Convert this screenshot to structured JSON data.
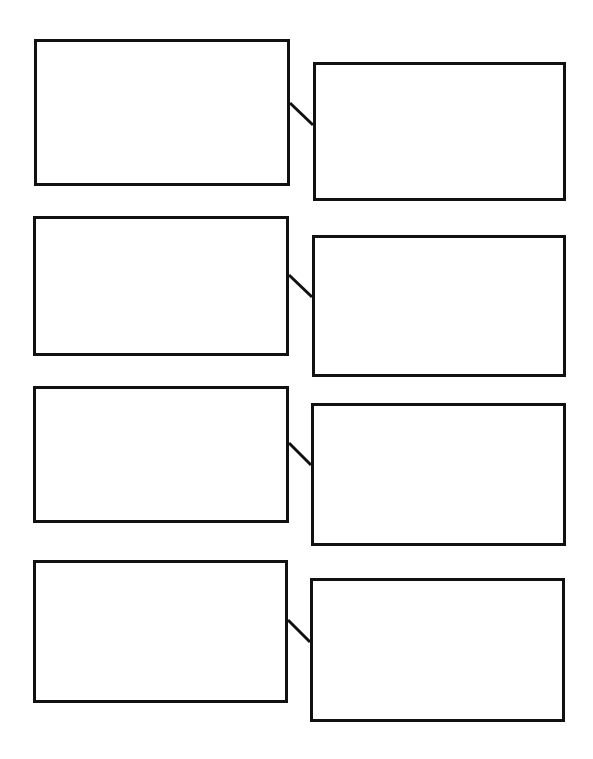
{
  "document": {
    "title": "Blank Paired-Box Graphic Organizer",
    "page_background": "#ffffff",
    "stroke_color": "#111111",
    "stroke_width_px": 3,
    "width_px": 593,
    "height_px": 759
  },
  "rows": [
    {
      "id": "row-1",
      "left_box": {
        "label": "",
        "placeholder": "",
        "x": 34,
        "y": 39,
        "w": 256,
        "h": 147
      },
      "right_box": {
        "label": "",
        "placeholder": "",
        "x": 313,
        "y": 62,
        "w": 253,
        "h": 139
      },
      "connector": {
        "x1": 290,
        "y1": 103,
        "x2": 313,
        "y2": 125
      }
    },
    {
      "id": "row-2",
      "left_box": {
        "label": "",
        "placeholder": "",
        "x": 33,
        "y": 216,
        "w": 256,
        "h": 140
      },
      "right_box": {
        "label": "",
        "placeholder": "",
        "x": 312,
        "y": 235,
        "w": 254,
        "h": 142
      },
      "connector": {
        "x1": 289,
        "y1": 275,
        "x2": 312,
        "y2": 297
      }
    },
    {
      "id": "row-3",
      "left_box": {
        "label": "",
        "placeholder": "",
        "x": 33,
        "y": 386,
        "w": 256,
        "h": 137
      },
      "right_box": {
        "label": "",
        "placeholder": "",
        "x": 311,
        "y": 403,
        "w": 255,
        "h": 143
      },
      "connector": {
        "x1": 289,
        "y1": 443,
        "x2": 311,
        "y2": 465
      }
    },
    {
      "id": "row-4",
      "left_box": {
        "label": "",
        "placeholder": "",
        "x": 33,
        "y": 560,
        "w": 255,
        "h": 143
      },
      "right_box": {
        "label": "",
        "placeholder": "",
        "x": 310,
        "y": 578,
        "w": 255,
        "h": 144
      },
      "connector": {
        "x1": 288,
        "y1": 620,
        "x2": 310,
        "y2": 642
      }
    }
  ]
}
